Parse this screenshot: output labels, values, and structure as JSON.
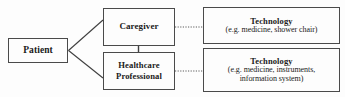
{
  "diagram": {
    "type": "block-flow-diagram",
    "background_color": "#fdfdfd",
    "border_color": "#4a4a4a",
    "text_color": "#1a1a1a",
    "nodes": {
      "patient": {
        "title": "Patient"
      },
      "caregiver": {
        "title": "Caregiver"
      },
      "healthcare_professional": {
        "title": "Healthcare Professional"
      },
      "technology_caregiver": {
        "title": "Technology",
        "subtitle": "(e.g. medicine, shower chair)"
      },
      "technology_professional": {
        "title": "Technology",
        "subtitle_line1": "(e.g. medicine, instruments,",
        "subtitle_line2": "information system)"
      }
    },
    "connectors": [
      {
        "name": "patient-to-caregiver",
        "style": "solid",
        "from": "patient",
        "to": "caregiver"
      },
      {
        "name": "patient-to-healthcare-professional",
        "style": "solid",
        "from": "patient",
        "to": "healthcare_professional"
      },
      {
        "name": "caregiver-to-healthcare-professional",
        "style": "solid",
        "from": "caregiver",
        "to": "healthcare_professional"
      },
      {
        "name": "caregiver-to-technology",
        "style": "dotted",
        "from": "caregiver",
        "to": "technology_caregiver"
      },
      {
        "name": "healthcare-professional-to-technology",
        "style": "dotted",
        "from": "healthcare_professional",
        "to": "technology_professional"
      }
    ]
  }
}
